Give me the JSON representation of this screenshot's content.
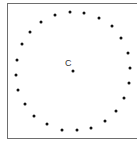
{
  "diagram": {
    "center_label": "C",
    "center": {
      "x": 73,
      "y": 71
    },
    "dot_color": "#111111",
    "frame_color": "#6e6e6e",
    "points": [
      [
        55,
        15
      ],
      [
        70,
        12
      ],
      [
        84,
        13
      ],
      [
        99,
        18
      ],
      [
        112,
        26
      ],
      [
        121,
        38
      ],
      [
        128,
        53
      ],
      [
        130,
        68
      ],
      [
        129,
        83
      ],
      [
        124,
        98
      ],
      [
        116,
        111
      ],
      [
        105,
        121
      ],
      [
        91,
        128
      ],
      [
        77,
        130
      ],
      [
        62,
        130
      ],
      [
        47,
        124
      ],
      [
        34,
        116
      ],
      [
        25,
        104
      ],
      [
        18,
        90
      ],
      [
        16,
        75
      ],
      [
        17,
        60
      ],
      [
        22,
        44
      ],
      [
        30,
        32
      ],
      [
        41,
        22
      ]
    ]
  }
}
